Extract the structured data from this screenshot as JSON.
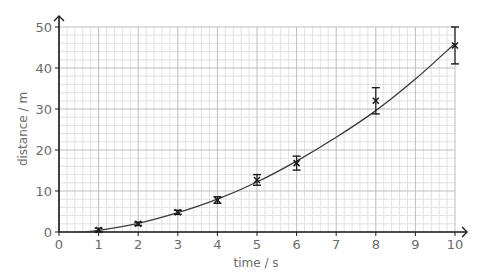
{
  "chart_data": {
    "type": "scatter",
    "title": "",
    "xlabel": "time / s",
    "ylabel": "distance / m",
    "xlim": [
      0,
      10
    ],
    "ylim": [
      0,
      50
    ],
    "x_ticks": [
      0,
      1,
      2,
      3,
      4,
      5,
      6,
      7,
      8,
      9,
      10
    ],
    "y_ticks": [
      0,
      10,
      20,
      30,
      40,
      50
    ],
    "grid": {
      "major_x": 1,
      "minor_x": 0.2,
      "major_y": 10,
      "minor_y": 2
    },
    "legend": null,
    "series": [
      {
        "name": "measurements",
        "marker": "x",
        "points": [
          {
            "x": 1,
            "y": 0.5,
            "err": 0.4
          },
          {
            "x": 2,
            "y": 2.0,
            "err": 0.4
          },
          {
            "x": 3,
            "y": 4.8,
            "err": 0.5
          },
          {
            "x": 4,
            "y": 7.8,
            "err": 0.8
          },
          {
            "x": 5,
            "y": 12.7,
            "err": 1.3
          },
          {
            "x": 6,
            "y": 16.8,
            "err": 1.7
          },
          {
            "x": 8,
            "y": 32.0,
            "err": 3.2
          },
          {
            "x": 10,
            "y": 45.5,
            "err": 4.5
          }
        ]
      },
      {
        "name": "best-fit curve",
        "type": "line",
        "points": [
          {
            "x": 0.5,
            "y": 0.0
          },
          {
            "x": 1,
            "y": 0.4
          },
          {
            "x": 2,
            "y": 2.1
          },
          {
            "x": 3,
            "y": 4.7
          },
          {
            "x": 4,
            "y": 8.0
          },
          {
            "x": 5,
            "y": 12.2
          },
          {
            "x": 6,
            "y": 17.3
          },
          {
            "x": 7,
            "y": 23.1
          },
          {
            "x": 8,
            "y": 29.6
          },
          {
            "x": 9,
            "y": 37.3
          },
          {
            "x": 10,
            "y": 46.0
          }
        ]
      }
    ]
  },
  "colors": {
    "axis": "#1a1a1a",
    "grid_major": "#bdbdbd",
    "grid_minor": "#e2e2e2",
    "data": "#1a1a1a",
    "text": "#6b6b6b"
  }
}
